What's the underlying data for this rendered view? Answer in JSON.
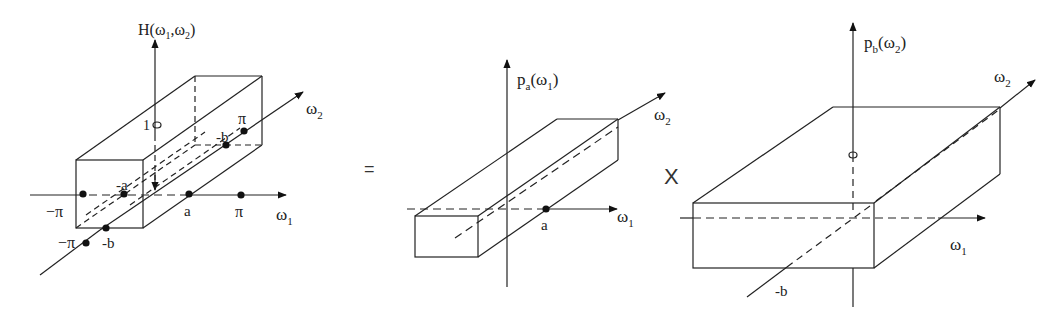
{
  "panels": [
    {
      "id": "H",
      "axis_vertical": {
        "func": "H",
        "args": [
          "ω",
          "1",
          ",",
          "ω",
          "2"
        ]
      },
      "axis_w1": {
        "label": "ω",
        "sub": "1"
      },
      "axis_w2": {
        "label": "ω",
        "sub": "2"
      },
      "ticks": {
        "neg_pi_w1": "−π",
        "neg_a": "-a",
        "a": "a",
        "pi_w1": "π",
        "neg_pi_w2": "−π",
        "neg_b_front": "-b",
        "neg_b_back": "-b",
        "pi_w2": "π",
        "height": "1"
      }
    },
    {
      "id": "pa",
      "axis_vertical": {
        "func": "p",
        "func_sub": "a",
        "arg": "ω",
        "arg_sub": "1"
      },
      "axis_w1": {
        "label": "ω",
        "sub": "1"
      },
      "axis_w2": {
        "label": "ω",
        "sub": "2"
      },
      "ticks": {
        "a": "a"
      }
    },
    {
      "id": "pb",
      "axis_vertical": {
        "func": "p",
        "func_sub": "b",
        "arg": "ω",
        "arg_sub": "2"
      },
      "axis_w1": {
        "label": "ω",
        "sub": "1"
      },
      "axis_w2": {
        "label": "ω",
        "sub": "2"
      },
      "ticks": {
        "neg_b": "-b"
      }
    }
  ],
  "operators": {
    "equals": "=",
    "times": "X"
  },
  "colors": {
    "stroke": "#222222",
    "background": "#ffffff"
  }
}
